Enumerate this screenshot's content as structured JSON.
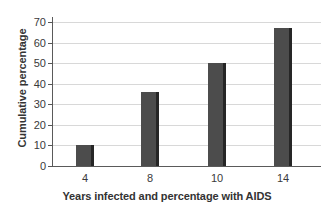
{
  "chart_data": {
    "type": "bar",
    "title": "",
    "categories": [
      "4",
      "8",
      "10",
      "14"
    ],
    "values": [
      10,
      36,
      50,
      67
    ],
    "series": [
      {
        "name": "Cumulative percentage with AIDS",
        "values": [
          10,
          36,
          50,
          67
        ]
      }
    ],
    "xlabel": "Years infected and percentage with AIDS",
    "ylabel": "Cumulative percentage",
    "ylim": [
      0,
      72
    ],
    "ytick_labels": [
      "0",
      "10",
      "20",
      "30",
      "40",
      "50",
      "60",
      "70"
    ],
    "ytick_values": [
      0,
      10,
      20,
      30,
      40,
      50,
      60,
      70
    ],
    "grid": "horizontal",
    "legend": "none",
    "bar_color": "#4c4c4c",
    "bar_shadow_color": "#262626",
    "grid_color": "#d8d8d8",
    "axis_color": "#5a5a5a",
    "text_color": "#3a3a3a",
    "background_color": "#ffffff"
  }
}
